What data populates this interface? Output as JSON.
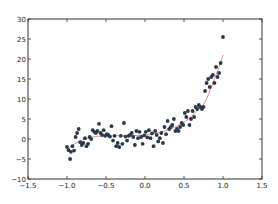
{
  "chart_data": {
    "type": "scatter",
    "title": "",
    "xlabel": "",
    "ylabel": "",
    "xlim": [
      -1.5,
      1.5
    ],
    "ylim": [
      -10,
      30
    ],
    "grid": false,
    "legend": null,
    "xticks": [
      "-1.5",
      "-1.0",
      "-0.5",
      "0.0",
      "0.5",
      "1.0",
      "1.5"
    ],
    "xtick_values": [
      -1.5,
      -1.0,
      -0.5,
      0.0,
      0.5,
      1.0,
      1.5
    ],
    "yticks": [
      "30",
      "25",
      "20",
      "15",
      "10",
      "5",
      "0",
      "-5",
      "-10"
    ],
    "ytick_values": [
      30,
      25,
      20,
      15,
      10,
      5,
      0,
      -5,
      -10
    ],
    "colors": {
      "points": "#2b3a4a",
      "fit_line": "#e08080",
      "axes": "#333333"
    },
    "series": [
      {
        "name": "data",
        "kind": "scatter",
        "x": [
          -1.0,
          -0.98,
          -0.96,
          -0.95,
          -0.93,
          -0.91,
          -0.89,
          -0.87,
          -0.85,
          -0.83,
          -0.81,
          -0.79,
          -0.77,
          -0.75,
          -0.73,
          -0.71,
          -0.69,
          -0.67,
          -0.65,
          -0.63,
          -0.61,
          -0.59,
          -0.57,
          -0.55,
          -0.53,
          -0.51,
          -0.49,
          -0.47,
          -0.45,
          -0.43,
          -0.41,
          -0.39,
          -0.37,
          -0.35,
          -0.33,
          -0.31,
          -0.29,
          -0.27,
          -0.25,
          -0.23,
          -0.21,
          -0.19,
          -0.17,
          -0.15,
          -0.13,
          -0.11,
          -0.09,
          -0.07,
          -0.05,
          -0.03,
          -0.01,
          0.01,
          0.03,
          0.05,
          0.07,
          0.09,
          0.11,
          0.13,
          0.15,
          0.17,
          0.19,
          0.21,
          0.23,
          0.25,
          0.27,
          0.29,
          0.31,
          0.33,
          0.35,
          0.37,
          0.39,
          0.41,
          0.43,
          0.45,
          0.47,
          0.49,
          0.51,
          0.53,
          0.55,
          0.57,
          0.59,
          0.61,
          0.63,
          0.65,
          0.67,
          0.69,
          0.71,
          0.73,
          0.75,
          0.77,
          0.79,
          0.81,
          0.83,
          0.85,
          0.87,
          0.89,
          0.91,
          0.93,
          0.95,
          0.97,
          1.0
        ],
        "y": [
          -2.0,
          -2.8,
          -5.0,
          -3.2,
          -1.8,
          -2.9,
          0.5,
          1.5,
          2.5,
          -0.8,
          -1.5,
          -1.0,
          0.2,
          -1.8,
          -1.2,
          0.5,
          0.0,
          2.2,
          1.8,
          1.5,
          2.0,
          3.8,
          1.5,
          1.0,
          2.2,
          0.8,
          1.2,
          1.0,
          0.6,
          3.2,
          -0.4,
          0.8,
          -1.8,
          -1.0,
          -2.0,
          0.8,
          -1.2,
          4.0,
          0.6,
          -0.4,
          0.8,
          1.0,
          1.5,
          0.5,
          -1.5,
          2.0,
          0.2,
          1.8,
          0.5,
          -1.2,
          0.9,
          1.8,
          0.4,
          2.2,
          0.2,
          1.4,
          -1.8,
          2.0,
          1.0,
          -0.6,
          0.2,
          1.5,
          -1.0,
          3.0,
          1.2,
          4.5,
          2.5,
          3.0,
          3.5,
          5.0,
          2.0,
          2.5,
          2.0,
          3.0,
          4.0,
          3.5,
          6.5,
          5.5,
          7.0,
          3.5,
          5.0,
          7.0,
          5.5,
          8.0,
          7.5,
          8.5,
          8.0,
          7.5,
          8.0,
          12.0,
          14.0,
          15.0,
          13.0,
          15.5,
          16.0,
          14.0,
          18.0,
          15.5,
          16.5,
          19.0,
          25.5
        ]
      },
      {
        "name": "fit",
        "kind": "line",
        "x": [
          -1.0,
          -0.9,
          -0.8,
          -0.7,
          -0.6,
          -0.5,
          -0.4,
          -0.3,
          -0.2,
          -0.1,
          0.0,
          0.1,
          0.2,
          0.3,
          0.4,
          0.5,
          0.6,
          0.7,
          0.75,
          0.8,
          0.85,
          0.9,
          0.95,
          1.0
        ],
        "y": [
          -2.5,
          -1.2,
          -0.2,
          0.4,
          0.7,
          0.8,
          0.8,
          0.8,
          0.8,
          0.9,
          1.0,
          1.3,
          1.7,
          2.3,
          3.1,
          4.2,
          5.7,
          7.8,
          8.5,
          10.5,
          13.0,
          15.5,
          18.0,
          21.0
        ]
      }
    ]
  }
}
